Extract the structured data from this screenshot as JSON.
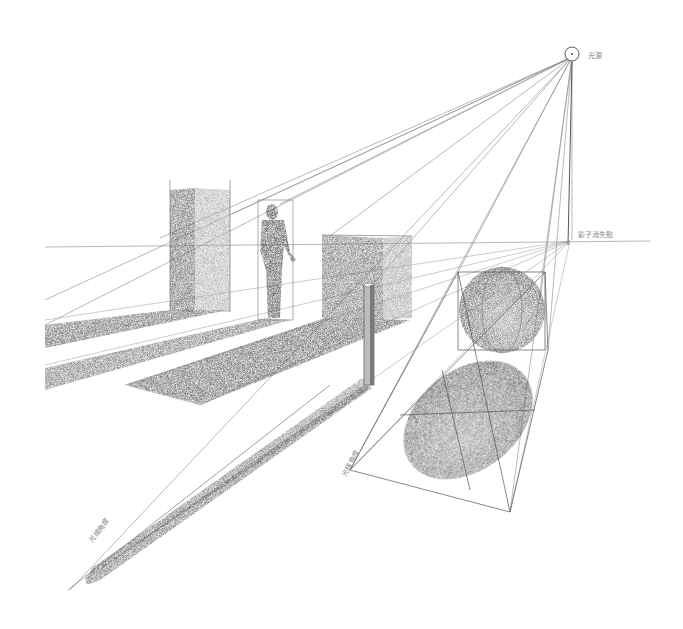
{
  "image": {
    "description": "Pencil sketch illustrating perspective shadow construction from a point light source",
    "width": 683,
    "height": 629,
    "background": "#ffffff",
    "stroke_color": "#4a4a4a",
    "shade_dark": "#3a3a3a",
    "shade_mid": "#6e6e6e",
    "shade_light": "#b5b5b5"
  },
  "labels": {
    "light_source": "光源",
    "shadow_vanishing_point": "影子消失點",
    "light_angle_left": "光線角度",
    "light_angle_right": "光線角度"
  },
  "objects": [
    {
      "name": "tall-box",
      "type": "box"
    },
    {
      "name": "standing-man",
      "type": "figure"
    },
    {
      "name": "cube",
      "type": "box"
    },
    {
      "name": "thin-pole",
      "type": "cylinder"
    },
    {
      "name": "sphere",
      "type": "sphere"
    },
    {
      "name": "sphere-shadow",
      "type": "ellipse-shadow"
    }
  ]
}
